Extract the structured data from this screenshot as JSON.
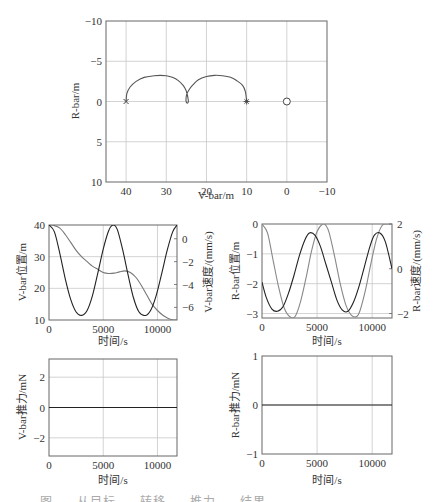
{
  "figure": {
    "caption": "图 ... 从目标 ... 转移 ... 推力 ... 结果 ..."
  },
  "chart_data": [
    {
      "id": "trajectory",
      "type": "line",
      "title": "",
      "xlabel": "V-bar/m",
      "ylabel": "R-bar/m",
      "xlim": [
        45,
        -10
      ],
      "ylim": [
        -10,
        10
      ],
      "x_reversed": true,
      "y_reversed": true,
      "xticks": [
        40,
        30,
        20,
        10,
        0,
        -10
      ],
      "yticks": [
        -10,
        -5,
        0,
        5,
        10
      ],
      "grid": true,
      "series": [
        {
          "name": "trajectory",
          "color": "#555555",
          "x": [
            40,
            39.8,
            39,
            37.5,
            35.5,
            33,
            31.5,
            30,
            28.5,
            27,
            25.8,
            25.1,
            24.8,
            24.6,
            24.5,
            24.7,
            25.0,
            25.1,
            24.9,
            24.4,
            23.5,
            22,
            20,
            18,
            16,
            14,
            12.5,
            11,
            10.3,
            10
          ],
          "y": [
            0,
            -1.0,
            -1.8,
            -2.5,
            -3.0,
            -3.2,
            -3.25,
            -3.2,
            -3.0,
            -2.6,
            -2.0,
            -1.4,
            -0.9,
            -0.4,
            0,
            0.2,
            0.1,
            -0.3,
            -0.9,
            -1.4,
            -2.0,
            -2.7,
            -3.1,
            -3.25,
            -3.2,
            -3.0,
            -2.6,
            -2.0,
            -1.2,
            0
          ]
        },
        {
          "name": "start-marker",
          "marker": "x",
          "x": [
            40
          ],
          "y": [
            0
          ]
        },
        {
          "name": "end-marker",
          "marker": "*",
          "x": [
            10
          ],
          "y": [
            0
          ]
        },
        {
          "name": "target",
          "marker": "o",
          "x": [
            0
          ],
          "y": [
            0
          ]
        }
      ]
    },
    {
      "id": "vbar",
      "type": "line",
      "xlabel": "时间/s",
      "ylabel": "V-bar位置/m",
      "ylabel_right": "V-bar速度/(mm/s)",
      "xlim": [
        0,
        11800
      ],
      "ylim": [
        10,
        40
      ],
      "ylim_right": [
        -7.1,
        1.2
      ],
      "xticks": [
        0,
        5000,
        10000
      ],
      "yticks": [
        10,
        20,
        30,
        40
      ],
      "yticks_right": [
        0,
        -2,
        -4,
        -6
      ],
      "grid": true,
      "series": [
        {
          "name": "V-bar位置",
          "axis": "left",
          "color": "#777777",
          "x": [
            0,
            500,
            1000,
            1500,
            2000,
            2500,
            3000,
            3500,
            4000,
            4500,
            5000,
            5500,
            6000,
            6500,
            7000,
            7500,
            8000,
            8500,
            9000,
            9500,
            10000,
            10500,
            11000,
            11500,
            11800
          ],
          "y": [
            40,
            39.8,
            39.0,
            37.0,
            34.5,
            32.0,
            30.0,
            28.5,
            27.0,
            26.0,
            25.0,
            24.7,
            24.8,
            25.2,
            25.5,
            25.0,
            23.5,
            21.0,
            18.0,
            15.0,
            13.0,
            11.5,
            10.5,
            10.0,
            10.0
          ]
        },
        {
          "name": "V-bar速度",
          "axis": "right",
          "color": "#222222",
          "x": [
            0,
            500,
            1000,
            1500,
            2000,
            2500,
            3000,
            3500,
            4000,
            4500,
            5000,
            5500,
            5900,
            6300,
            6800,
            7300,
            7800,
            8300,
            8900,
            9400,
            9900,
            10400,
            10900,
            11400,
            11800
          ],
          "y": [
            1.2,
            0.6,
            -1.3,
            -3.5,
            -5.3,
            -6.4,
            -6.7,
            -6.3,
            -5.0,
            -3.0,
            -0.9,
            0.7,
            1.2,
            0.8,
            -1.0,
            -3.2,
            -5.2,
            -6.4,
            -6.7,
            -6.2,
            -4.9,
            -3.0,
            -1.0,
            0.6,
            1.2
          ]
        }
      ]
    },
    {
      "id": "rbar",
      "type": "line",
      "xlabel": "时间/s",
      "ylabel": "R-bar位置/m",
      "ylabel_right": "R-bar速度/(mm/s)",
      "xlim": [
        0,
        11800
      ],
      "ylim": [
        -3.15,
        0
      ],
      "ylim_right": [
        -2.2,
        2
      ],
      "xticks": [
        0,
        5000,
        10000
      ],
      "yticks": [
        0,
        -1,
        -2,
        -3
      ],
      "yticks_right": [
        2,
        0,
        -2
      ],
      "grid": true,
      "series": [
        {
          "name": "R-bar位置",
          "axis": "left",
          "color": "#888888",
          "x": [
            0,
            500,
            1000,
            1500,
            2000,
            2500,
            3000,
            3500,
            4000,
            4500,
            5000,
            5500,
            5800,
            6100,
            6600,
            7100,
            7600,
            8100,
            8600,
            8900,
            9400,
            9900,
            10400,
            10900,
            11400,
            11800
          ],
          "y": [
            0,
            -0.3,
            -1.2,
            -2.1,
            -2.8,
            -3.1,
            -3.1,
            -2.6,
            -1.8,
            -0.9,
            -0.25,
            0,
            -0.05,
            -0.3,
            -1.1,
            -2.0,
            -2.7,
            -3.05,
            -3.1,
            -2.9,
            -2.2,
            -1.3,
            -0.5,
            -0.05,
            0,
            0
          ]
        },
        {
          "name": "R-bar速度",
          "axis": "right",
          "color": "#222222",
          "x": [
            0,
            400,
            900,
            1400,
            1900,
            2400,
            2900,
            3400,
            3900,
            4300,
            4800,
            5300,
            5800,
            6300,
            6800,
            7300,
            7800,
            8300,
            8800,
            9300,
            9800,
            10200,
            10700,
            11200,
            11800
          ],
          "y": [
            -0.6,
            -1.3,
            -1.8,
            -1.9,
            -1.7,
            -1.1,
            -0.3,
            0.6,
            1.3,
            1.6,
            1.5,
            1.0,
            0.2,
            -0.6,
            -1.4,
            -1.85,
            -1.9,
            -1.5,
            -0.8,
            0.1,
            1.0,
            1.5,
            1.6,
            1.2,
            0.0
          ]
        }
      ]
    },
    {
      "id": "vthrust",
      "type": "line",
      "xlabel": "时间/s",
      "ylabel": "V-bar推力/mN",
      "xlim": [
        0,
        11800
      ],
      "ylim": [
        -3.2,
        3.2
      ],
      "xticks": [
        0,
        5000,
        10000
      ],
      "yticks": [
        2,
        0,
        -2
      ],
      "grid": true,
      "series": [
        {
          "name": "V-bar推力",
          "color": "#222222",
          "x": [
            0,
            11800
          ],
          "y": [
            0,
            0
          ]
        }
      ]
    },
    {
      "id": "rthrust",
      "type": "line",
      "xlabel": "时间/s",
      "ylabel": "R-bar推力/mN",
      "xlim": [
        0,
        11800
      ],
      "ylim": [
        -1,
        1
      ],
      "xticks": [
        0,
        5000,
        10000
      ],
      "yticks": [
        1,
        0,
        -1
      ],
      "grid": true,
      "series": [
        {
          "name": "R-bar推力",
          "color": "#222222",
          "x": [
            0,
            11800
          ],
          "y": [
            0,
            0
          ]
        }
      ]
    }
  ]
}
